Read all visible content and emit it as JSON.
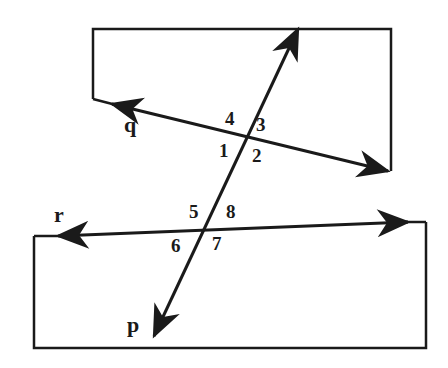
{
  "diagram": {
    "type": "geometry-transversal",
    "lines": {
      "q": {
        "label": "q"
      },
      "r": {
        "label": "r"
      },
      "p": {
        "label": "p",
        "role": "transversal"
      }
    },
    "angles_upper": [
      "1",
      "2",
      "3",
      "4"
    ],
    "angles_lower": [
      "5",
      "6",
      "7",
      "8"
    ],
    "colors": {
      "stroke": "#1a1a1a",
      "background": "#ffffff"
    }
  }
}
